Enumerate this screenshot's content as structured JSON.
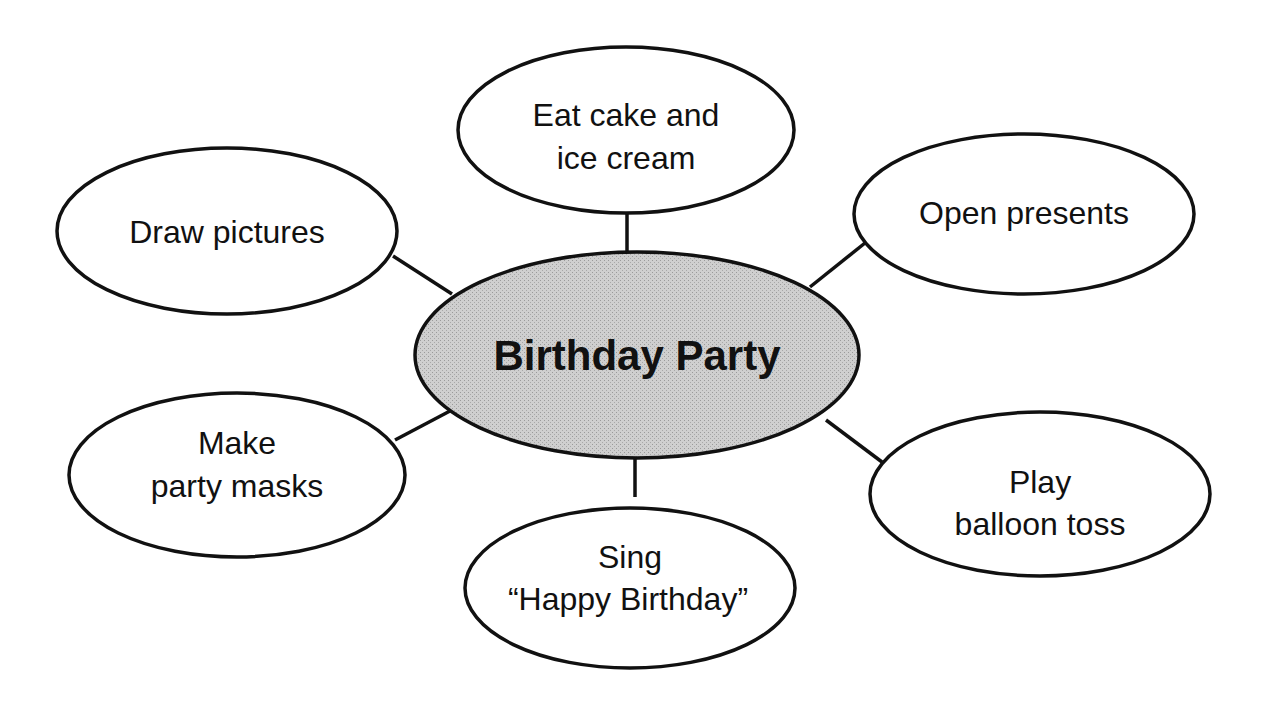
{
  "diagram": {
    "type": "concept-web",
    "center": {
      "label": "Birthday Party",
      "fill": "#c8c8c8"
    },
    "nodes": [
      {
        "id": "eat-cake",
        "lines": [
          "Eat cake and",
          "ice cream"
        ]
      },
      {
        "id": "open-presents",
        "lines": [
          "Open presents"
        ]
      },
      {
        "id": "play-balloon-toss",
        "lines": [
          "Play",
          "balloon toss"
        ]
      },
      {
        "id": "sing-happy-birthday",
        "lines": [
          "Sing",
          "“Happy Birthday”"
        ]
      },
      {
        "id": "make-party-masks",
        "lines": [
          "Make",
          "party masks"
        ]
      },
      {
        "id": "draw-pictures",
        "lines": [
          "Draw pictures"
        ]
      }
    ],
    "colors": {
      "stroke": "#111111",
      "background": "#ffffff",
      "center_fill": "#c8c8c8"
    }
  }
}
